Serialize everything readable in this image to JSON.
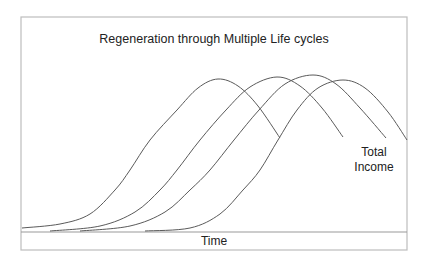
{
  "chart_data": {
    "type": "line",
    "title": "Regeneration through Multiple Life cycles",
    "xlabel": "Time",
    "ylabel": "",
    "annotation": [
      "Total",
      "Income"
    ],
    "grid": false,
    "legend": "none",
    "colors": {
      "curve": "#5a5a5a",
      "frame": "#bdbdbd",
      "text": "#222222"
    },
    "series": [
      {
        "name": "Life cycle 1",
        "points": [
          [
            22,
            228
          ],
          [
            60,
            224
          ],
          [
            90,
            214
          ],
          [
            115,
            190
          ],
          [
            130,
            170
          ],
          [
            150,
            140
          ],
          [
            177,
            110
          ],
          [
            198,
            88
          ],
          [
            218,
            79
          ],
          [
            238,
            86
          ],
          [
            258,
            106
          ],
          [
            280,
            138
          ]
        ]
      },
      {
        "name": "Life cycle 2",
        "points": [
          [
            50,
            231
          ],
          [
            100,
            226
          ],
          [
            135,
            212
          ],
          [
            160,
            190
          ],
          [
            177,
            170
          ],
          [
            200,
            140
          ],
          [
            226,
            110
          ],
          [
            250,
            87
          ],
          [
            277,
            77
          ],
          [
            300,
            86
          ],
          [
            322,
            108
          ],
          [
            343,
            137
          ]
        ]
      },
      {
        "name": "Life cycle 3",
        "points": [
          [
            80,
            231
          ],
          [
            130,
            226
          ],
          [
            165,
            212
          ],
          [
            190,
            190
          ],
          [
            210,
            170
          ],
          [
            234,
            140
          ],
          [
            259,
            110
          ],
          [
            285,
            84
          ],
          [
            313,
            75
          ],
          [
            336,
            84
          ],
          [
            360,
            108
          ],
          [
            386,
            138
          ]
        ]
      },
      {
        "name": "Life cycle 4",
        "points": [
          [
            145,
            231
          ],
          [
            190,
            228
          ],
          [
            220,
            214
          ],
          [
            243,
            190
          ],
          [
            260,
            170
          ],
          [
            278,
            140
          ],
          [
            297,
            110
          ],
          [
            318,
            88
          ],
          [
            343,
            80
          ],
          [
            365,
            88
          ],
          [
            388,
            112
          ],
          [
            407,
            140
          ]
        ]
      }
    ]
  },
  "labels": {
    "title": "Regeneration through Multiple Life cycles",
    "xlabel": "Time",
    "series_label_line1": "Total",
    "series_label_line2": "Income"
  }
}
